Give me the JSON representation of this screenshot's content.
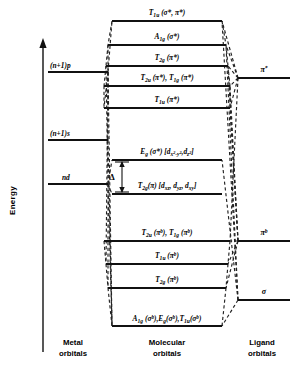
{
  "figure": {
    "axis_label": "Energy",
    "columns": {
      "metal_line1": "Metal",
      "metal_line2": "orbitals",
      "molecular_line1": "Molecular",
      "molecular_line2": "orbitals",
      "ligand_line1": "Ligand",
      "ligand_line2": "orbitals"
    },
    "splitting_label": "Δ"
  },
  "metal_levels": [
    {
      "id": "metal-p",
      "label": "(n+1)p",
      "y": 72,
      "x1": 48,
      "x2": 108
    },
    {
      "id": "metal-s",
      "label": "(n+1)s",
      "y": 140,
      "x1": 48,
      "x2": 108
    },
    {
      "id": "metal-d",
      "label": "nd",
      "y": 184,
      "x1": 48,
      "x2": 108
    }
  ],
  "molecular_levels": [
    {
      "id": "mo-t1u-star",
      "label": "T₁ᵤ (σ*, π*)",
      "y": 21,
      "x1": 112,
      "x2": 222,
      "label_y": 14
    },
    {
      "id": "mo-a1g-star",
      "label": "A₁g (σ*)",
      "y": 45,
      "x1": 108,
      "x2": 226,
      "label_y": 38
    },
    {
      "id": "mo-t2g-star",
      "label": "T₂g (π*)",
      "y": 66,
      "x1": 106,
      "x2": 228,
      "label_y": 59
    },
    {
      "id": "mo-t2u-t1g-star",
      "label": "T₂ᵤ (π*), T₁g (π*)",
      "y": 86,
      "x1": 104,
      "x2": 230,
      "label_y": 79
    },
    {
      "id": "mo-t1u-star-lower",
      "label": "T₁ᵤ (π*)",
      "y": 108,
      "x1": 104,
      "x2": 230,
      "label_y": 101
    },
    {
      "id": "mo-eg-star",
      "label": "E_g (σ*) [d_{x²−y²}, d_{z²}]",
      "y": 160,
      "x1": 112,
      "x2": 222,
      "label_y": 153
    },
    {
      "id": "mo-t2g",
      "label": "T₂g (π) [d_{xz}, d_{yz}, d_{xy}]",
      "y": 194,
      "x1": 112,
      "x2": 222,
      "label_y": 187
    },
    {
      "id": "mo-t2u-t1g-b",
      "label": "T₂ᵤ (πᵇ), T₁g (πᵇ)",
      "y": 241,
      "x1": 104,
      "x2": 230,
      "label_y": 234
    },
    {
      "id": "mo-t1u-b",
      "label": "T₁ᵤ (πᵇ)",
      "y": 264,
      "x1": 106,
      "x2": 228,
      "label_y": 257
    },
    {
      "id": "mo-t2g-b",
      "label": "T₂g (πᵇ)",
      "y": 288,
      "x1": 108,
      "x2": 226,
      "label_y": 281
    },
    {
      "id": "mo-sigma-b",
      "label": "A₁g (σᵇ), E_g (σᵇ), T₁ᵤ (σᵇ)",
      "y": 326,
      "x1": 112,
      "x2": 222,
      "label_y": 320
    }
  ],
  "ligand_levels": [
    {
      "id": "ligand-pi-star",
      "label": "π*",
      "y": 78,
      "x1": 238,
      "x2": 290,
      "label_y": 71
    },
    {
      "id": "ligand-pi-b",
      "label": "πᵇ",
      "y": 241,
      "x1": 238,
      "x2": 290,
      "label_y": 234
    },
    {
      "id": "ligand-sigma",
      "label": "σ",
      "y": 300,
      "x1": 238,
      "x2": 290,
      "label_y": 293
    }
  ],
  "eg_star_label_parts": {
    "main": "E",
    "sub": "g",
    "paren": " (σ*)",
    "bracket_open": "[",
    "d1": "d",
    "d1sub": "x²-y²",
    "comma": ",",
    "d2": "d",
    "d2sub": "z²",
    "bracket_close": "]"
  },
  "t2g_label_parts": {
    "main": "T",
    "sub": "2g",
    "paren": "(π)",
    "bracket_open": "[",
    "d1": "d",
    "d1sub": "xz",
    "d2": "d",
    "d2sub": "yz",
    "d3": "d",
    "d3sub": "xy",
    "bracket_close": "]"
  },
  "colors": {
    "line": "#111111",
    "dashed": "#222222",
    "background": "#ffffff",
    "text": "#000000"
  }
}
